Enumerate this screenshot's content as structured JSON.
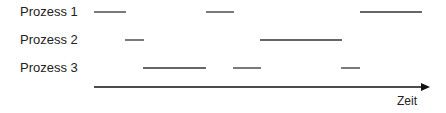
{
  "diagram": {
    "type": "timeline",
    "processes": [
      {
        "label": "Prozess 1",
        "y": 12,
        "segments": [
          [
            94,
            126
          ],
          [
            206,
            234
          ],
          [
            360,
            422
          ]
        ]
      },
      {
        "label": "Prozess 2",
        "y": 40,
        "segments": [
          [
            125,
            144
          ],
          [
            260,
            342
          ]
        ]
      },
      {
        "label": "Prozess 3",
        "y": 68,
        "segments": [
          [
            143,
            206
          ],
          [
            233,
            261
          ],
          [
            341,
            360
          ]
        ]
      }
    ],
    "axis": {
      "label": "Zeit",
      "x1": 94,
      "x2": 430,
      "y": 87
    },
    "line_color": "#333333"
  }
}
